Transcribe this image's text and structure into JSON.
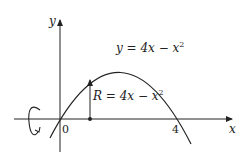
{
  "diagram": {
    "axes": {
      "x_label": "x",
      "y_label": "y",
      "origin_label": "0",
      "x_tick_label": "4"
    },
    "curve": {
      "equation_label": "y = 4x − x²",
      "equation_lhs": "y = 4x − x",
      "equation_exp": "2"
    },
    "radius": {
      "label_lhs": "R = 4x − x",
      "label_exp": "2"
    },
    "rotation_symbol": "rotation-about-x-axis",
    "colors": {
      "stroke": "#222222",
      "background": "#ffffff"
    }
  }
}
